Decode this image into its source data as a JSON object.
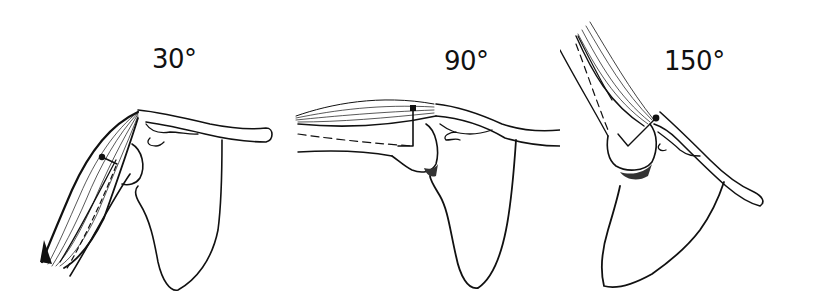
{
  "figure": {
    "type": "anatomical line drawing",
    "panels": [
      {
        "label": "30°",
        "angle": 30
      },
      {
        "label": "90°",
        "angle": 90
      },
      {
        "label": "150°",
        "angle": 150
      }
    ]
  },
  "colors": {
    "ink": "#111111",
    "background": "#ffffff"
  }
}
